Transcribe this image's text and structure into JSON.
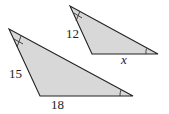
{
  "figure": {
    "fill_color": "#d8d8d8",
    "stroke_color": "#222222",
    "large_triangle": {
      "vertices": [
        [
          9,
          29
        ],
        [
          40,
          96
        ],
        [
          133,
          96
        ]
      ],
      "side_labels": {
        "left": "15",
        "bottom": "18"
      }
    },
    "small_triangle": {
      "vertices": [
        [
          70,
          6
        ],
        [
          92,
          54
        ],
        [
          158,
          54
        ]
      ],
      "side_labels": {
        "left": "12",
        "bottom": "x"
      }
    }
  }
}
